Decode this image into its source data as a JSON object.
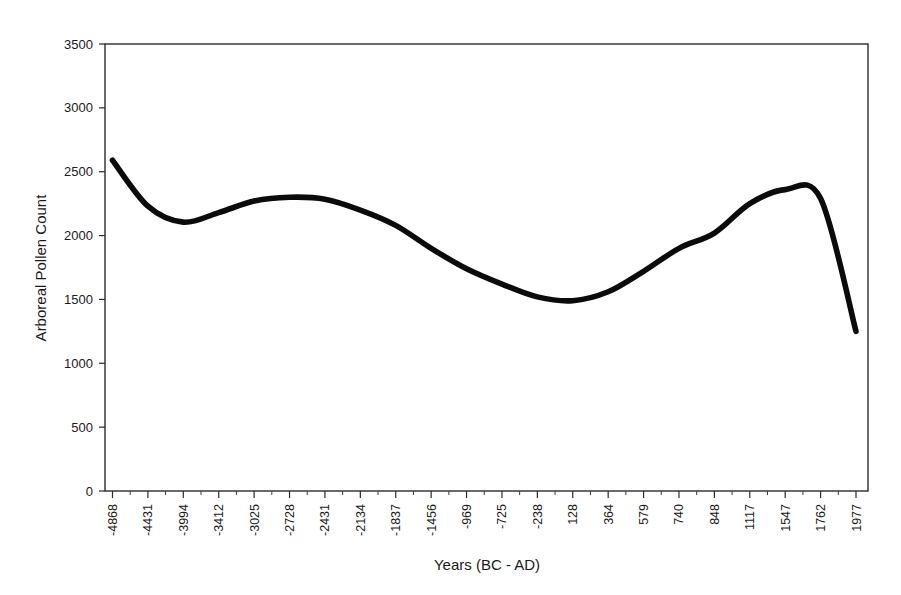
{
  "chart_data": {
    "type": "line",
    "title": "",
    "xlabel": "Years (BC - AD)",
    "ylabel": "Arboreal Pollen Count",
    "grid": false,
    "legend": false,
    "legend_position": "none",
    "series_color": "#000000",
    "background_color": "#ffffff",
    "frame_color": "#2b2b2b",
    "ylim": [
      0,
      3500
    ],
    "yticks": [
      0,
      500,
      1000,
      1500,
      2000,
      2500,
      3000,
      3500
    ],
    "ytick_labels": [
      "0",
      "500",
      "1000",
      "1500",
      "2000",
      "2500",
      "3000",
      "3500"
    ],
    "categories": [
      "-4868",
      "-4431",
      "-3994",
      "-3412",
      "-3025",
      "-2728",
      "-2431",
      "-2134",
      "-1837",
      "-1456",
      "-969",
      "-725",
      "-238",
      "128",
      "364",
      "579",
      "740",
      "848",
      "1117",
      "1547",
      "1762",
      "1977"
    ],
    "xtick_labels": [
      "-4868",
      "-4431",
      "-3994",
      "-3412",
      "-3025",
      "-2728",
      "-2431",
      "-2134",
      "-1837",
      "-1456",
      "-969",
      "-725",
      "-238",
      "128",
      "364",
      "579",
      "740",
      "848",
      "1117",
      "1547",
      "1762",
      "1977"
    ],
    "series": [
      {
        "name": "Arboreal Pollen Count",
        "values": [
          2590,
          2230,
          2105,
          2180,
          2270,
          2300,
          2285,
          2200,
          2080,
          1900,
          1740,
          1620,
          1520,
          1490,
          1560,
          1720,
          1900,
          2020,
          2250,
          2360,
          2290,
          1250
        ]
      }
    ],
    "annotations": {
      "start_value": 2590,
      "first_minimum": 2105,
      "first_maximum": 2300,
      "global_minimum": 1490,
      "second_maximum": 2360,
      "end_value": 1250
    }
  },
  "axes": {
    "y_title": "Arboreal Pollen Count",
    "x_title": "Years (BC - AD)"
  }
}
